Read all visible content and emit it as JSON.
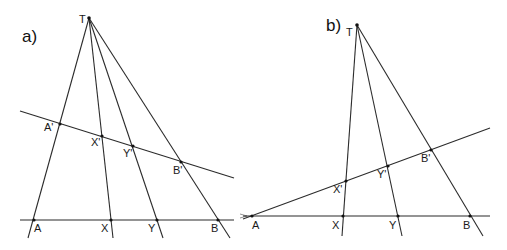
{
  "diagrams": [
    {
      "panel_label": "a)",
      "apex": {
        "name": "T",
        "x": 89,
        "y": 18
      },
      "base_line": {
        "x1": 20,
        "y1": 220,
        "x2": 234,
        "y2": 220
      },
      "transversal": {
        "x1": 20,
        "y1": 111,
        "x2": 234,
        "y2": 178
      },
      "base_points": [
        {
          "name": "A",
          "x": 34,
          "y": 220
        },
        {
          "name": "X",
          "x": 111,
          "y": 220
        },
        {
          "name": "Y",
          "x": 157,
          "y": 220
        },
        {
          "name": "B",
          "x": 218,
          "y": 220
        }
      ],
      "transversal_points": [
        {
          "name": "A'",
          "x": 60,
          "y": 124
        },
        {
          "name": "X'",
          "x": 102,
          "y": 136
        },
        {
          "name": "Y'",
          "x": 133,
          "y": 146
        },
        {
          "name": "B'",
          "x": 181,
          "y": 162
        }
      ]
    },
    {
      "panel_label": "b)",
      "apex": {
        "name": "T",
        "x": 357,
        "y": 25
      },
      "base_line": {
        "x1": 243,
        "y1": 216,
        "x2": 490,
        "y2": 216
      },
      "transversal": {
        "x1": 243,
        "y1": 219,
        "x2": 490,
        "y2": 128
      },
      "base_points": [
        {
          "name": "A",
          "x": 252,
          "y": 216
        },
        {
          "name": "X",
          "x": 343,
          "y": 216
        },
        {
          "name": "Y",
          "x": 398,
          "y": 216
        },
        {
          "name": "B",
          "x": 470,
          "y": 216
        }
      ],
      "transversal_points": [
        {
          "name": "X'",
          "x": 346,
          "y": 181
        },
        {
          "name": "Y'",
          "x": 388,
          "y": 166
        },
        {
          "name": "B'",
          "x": 431,
          "y": 150
        }
      ]
    }
  ]
}
